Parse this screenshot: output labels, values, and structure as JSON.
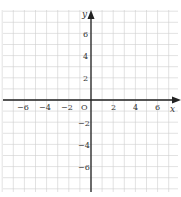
{
  "diagram": {
    "type": "coordinate-plane",
    "x_axis": {
      "label": "x",
      "tick_labels": [
        "-6",
        "-4",
        "-2",
        "2",
        "4",
        "6"
      ],
      "range": [
        -8,
        8
      ]
    },
    "y_axis": {
      "label": "y",
      "tick_labels": [
        "6",
        "4",
        "2",
        "-2",
        "-4",
        "-6"
      ],
      "range": [
        -8,
        8
      ]
    },
    "origin_label": "O",
    "grid": {
      "unit": 1,
      "visible": true
    },
    "colors": {
      "grid": "#cccccc",
      "axis": "#222222",
      "text": "#333333"
    }
  }
}
